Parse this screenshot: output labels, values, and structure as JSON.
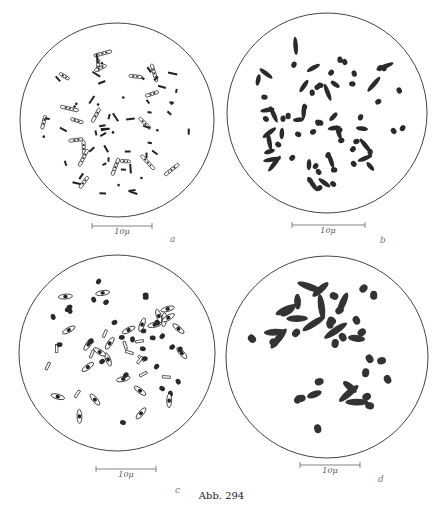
{
  "figure": {
    "caption": "Abb. 294",
    "panels": [
      {
        "id": "a",
        "label": "a",
        "scale_bar": "10μ",
        "style": "slender rods with banded/outlined segments, some short dark rods and dots",
        "circle": {
          "cx": 117,
          "cy": 120,
          "r": 97
        },
        "scale": {
          "x1": 92,
          "x2": 152,
          "y": 226
        },
        "label_pos": {
          "x": 170,
          "y": 241
        }
      },
      {
        "id": "b",
        "label": "b",
        "scale_bar": "10μ",
        "style": "solid dark short rods and oval cocci",
        "circle": {
          "cx": 327,
          "cy": 113,
          "r": 100
        },
        "scale": {
          "x1": 292,
          "x2": 365,
          "y": 225
        },
        "label_pos": {
          "x": 380,
          "y": 242
        }
      },
      {
        "id": "c",
        "label": "c",
        "scale_bar": "10μ",
        "style": "mix of dark ovals and spindle-shaped outlined cells with dark center",
        "circle": {
          "cx": 117,
          "cy": 353,
          "r": 98
        },
        "scale": {
          "x1": 96,
          "x2": 156,
          "y": 469
        },
        "label_pos": {
          "x": 175,
          "y": 492
        }
      },
      {
        "id": "d",
        "label": "d",
        "scale_bar": "10μ",
        "style": "larger solid dark ovals and rods",
        "circle": {
          "cx": 327,
          "cy": 357,
          "r": 101
        },
        "scale": {
          "x1": 300,
          "x2": 360,
          "y": 465
        },
        "label_pos": {
          "x": 378,
          "y": 481
        }
      }
    ]
  }
}
